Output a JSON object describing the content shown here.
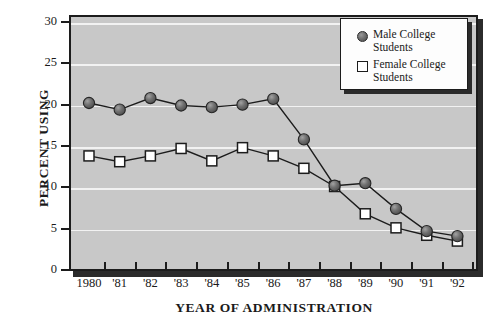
{
  "chart_data": {
    "type": "line",
    "title": "",
    "xlabel": "YEAR OF ADMINISTRATION",
    "ylabel": "PERCENT USING",
    "categories": [
      "1980",
      "'81",
      "'82",
      "'83",
      "'84",
      "'85",
      "'86",
      "'87",
      "'88",
      "'89",
      "'90",
      "'91",
      "'92"
    ],
    "x_tick_labels": [
      "1980",
      "'81",
      "'82",
      "'83",
      "'84",
      "'85",
      "'86",
      "'87",
      "'88",
      "'89",
      "'90",
      "'91",
      "'92"
    ],
    "y_tick_labels": [
      "0",
      "5",
      "10",
      "15",
      "20",
      "25",
      "30"
    ],
    "y_ticks": [
      0,
      5,
      10,
      15,
      20,
      25,
      30
    ],
    "ylim": [
      0,
      31
    ],
    "grid": "horizontal",
    "legend_position": "top-right",
    "series": [
      {
        "name": "Male College Students",
        "marker": "filled-circle",
        "color": "#6e6e6e",
        "values": [
          20.2,
          19.4,
          20.8,
          19.9,
          19.7,
          20.0,
          20.7,
          15.8,
          10.2,
          10.5,
          7.4,
          4.7,
          4.1
        ]
      },
      {
        "name": "Female College Students",
        "marker": "open-square",
        "color": "#ffffff",
        "values": [
          13.8,
          13.1,
          13.8,
          14.7,
          13.2,
          14.8,
          13.8,
          12.3,
          10.1,
          6.8,
          5.1,
          4.2,
          3.5
        ]
      }
    ]
  },
  "legend": {
    "items": [
      {
        "label": "Male College Students",
        "marker": "filled-circle"
      },
      {
        "label": "Female College Students",
        "marker": "open-square"
      }
    ]
  },
  "colors": {
    "plot_background": "#c8c8c8",
    "gridline": "#f2f2f2",
    "axis": "#1c1c1c",
    "male_marker": "#6e6e6e",
    "female_marker": "#ffffff",
    "legend_background": "#fdfdfd",
    "shadow": "#2b2b2b"
  }
}
